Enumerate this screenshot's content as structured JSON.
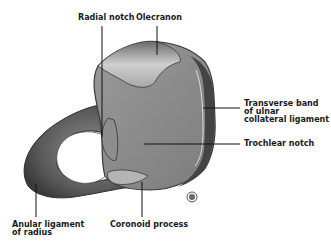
{
  "figure": {
    "labels": {
      "radial_notch": [
        "Radial notch"
      ],
      "olecranon": [
        "Olecranon"
      ],
      "transverse_band": [
        "Transverse band",
        "of ulnar",
        "collateral ligament"
      ],
      "trochlear_notch": [
        "Trochlear notch"
      ],
      "anular_ligament": [
        "Anular ligament",
        "of radius"
      ],
      "coronoid_process": [
        "Coronoid process"
      ]
    },
    "logo": "publisher-logo"
  }
}
